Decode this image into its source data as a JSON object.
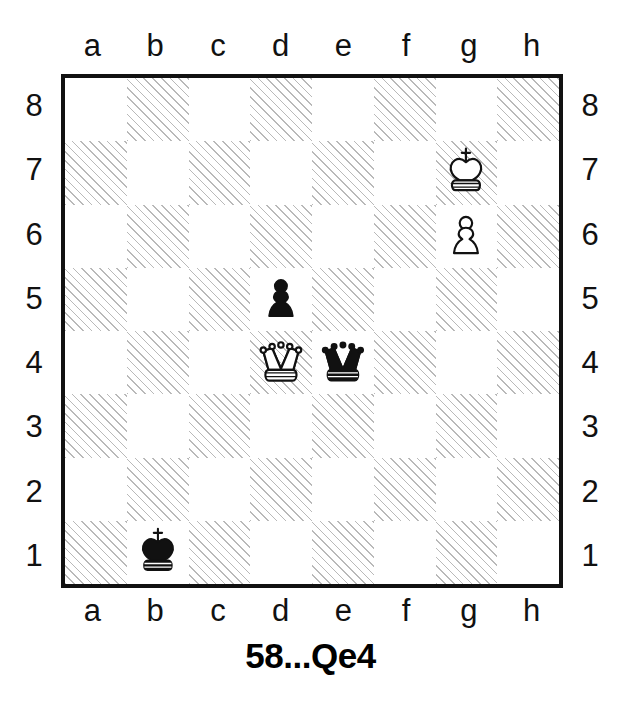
{
  "diagram": {
    "type": "chess-board",
    "caption": "58...Qe4",
    "orientation": "white-bottom",
    "files": [
      "a",
      "b",
      "c",
      "d",
      "e",
      "f",
      "g",
      "h"
    ],
    "ranks": [
      "8",
      "7",
      "6",
      "5",
      "4",
      "3",
      "2",
      "1"
    ],
    "colors": {
      "light_square": "#ffffff",
      "dark_square_hatch": "#b9b9b9",
      "border": "#111111",
      "piece_black": "#111111",
      "piece_white_fill": "#ffffff",
      "piece_outline": "#111111",
      "text": "#111111"
    },
    "pieces": [
      {
        "square": "g7",
        "color": "white",
        "type": "king",
        "glyph": "white-king-icon"
      },
      {
        "square": "g6",
        "color": "white",
        "type": "pawn",
        "glyph": "white-pawn-icon"
      },
      {
        "square": "d5",
        "color": "black",
        "type": "pawn",
        "glyph": "black-pawn-icon"
      },
      {
        "square": "d4",
        "color": "white",
        "type": "queen",
        "glyph": "white-queen-icon"
      },
      {
        "square": "e4",
        "color": "black",
        "type": "queen",
        "glyph": "black-queen-icon"
      },
      {
        "square": "b1",
        "color": "black",
        "type": "king",
        "glyph": "black-king-icon"
      }
    ],
    "fen_placement": "6k1/6P1/8/3p4/3QqP2/8/8/1k6"
  }
}
